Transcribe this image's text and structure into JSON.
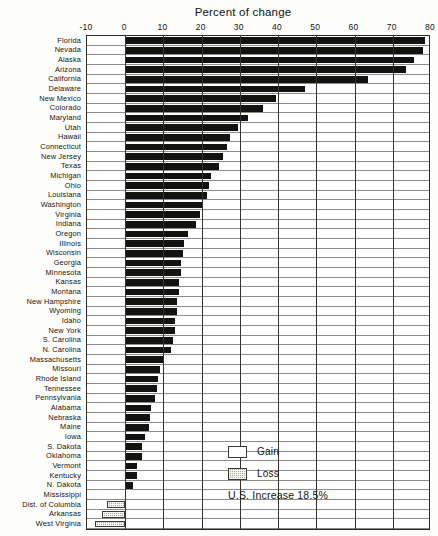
{
  "chart_data": {
    "type": "bar",
    "orientation": "horizontal",
    "title": "Percent of change",
    "xlabel": "Percent of change",
    "ylabel": "",
    "xlim": [
      -10,
      80
    ],
    "xticks": [
      -10,
      0,
      10,
      20,
      30,
      40,
      50,
      60,
      70,
      80
    ],
    "xtick_labels": [
      "-10",
      "0",
      "10",
      "20",
      "30",
      "40",
      "50",
      "60",
      "70",
      "80"
    ],
    "grid": true,
    "legend_position": "lower-right",
    "legend": [
      {
        "label": "Gain",
        "swatch": "white"
      },
      {
        "label": "Loss",
        "swatch": "hatched-gray"
      }
    ],
    "annotation": "U.S. Increase 18.5%",
    "categories": [
      "Florida",
      "Nevada",
      "Alaska",
      "Arizona",
      "California",
      "Delaware",
      "New Mexico",
      "Colorado",
      "Maryland",
      "Utah",
      "Hawaii",
      "Connecticut",
      "New Jersey",
      "Texas",
      "Michigan",
      "Ohio",
      "Louisiana",
      "Washington",
      "Virginia",
      "Indiana",
      "Oregon",
      "Illinois",
      "Wisconsin",
      "Georgia",
      "Minnesota",
      "Kansas",
      "Montana",
      "New Hampshire",
      "Wyoming",
      "Idaho",
      "New York",
      "S. Carolina",
      "N. Carolina",
      "Massachusetts",
      "Missouri",
      "Rhode Island",
      "Tennessee",
      "Pennsylvania",
      "Alabama",
      "Nebraska",
      "Maine",
      "Iowa",
      "S. Dakota",
      "Oklahoma",
      "Vermont",
      "Kentucky",
      "N. Dakota",
      "Mississippi",
      "Dist. of Columbia",
      "Arkansas",
      "West Virginia"
    ],
    "values": [
      78.5,
      78.0,
      75.5,
      73.5,
      63.5,
      47.0,
      39.5,
      36.0,
      32.0,
      29.5,
      27.5,
      26.5,
      25.5,
      24.5,
      22.5,
      22.0,
      21.5,
      20.0,
      19.5,
      18.5,
      16.5,
      15.5,
      15.0,
      14.5,
      14.5,
      14.0,
      14.0,
      13.5,
      13.5,
      13.0,
      13.0,
      12.5,
      12.0,
      9.8,
      9.2,
      8.5,
      8.3,
      7.8,
      6.7,
      6.5,
      6.1,
      5.2,
      4.3,
      4.3,
      3.2,
      3.2,
      2.1,
      0.0,
      -4.7,
      -6.0,
      -7.8
    ]
  }
}
